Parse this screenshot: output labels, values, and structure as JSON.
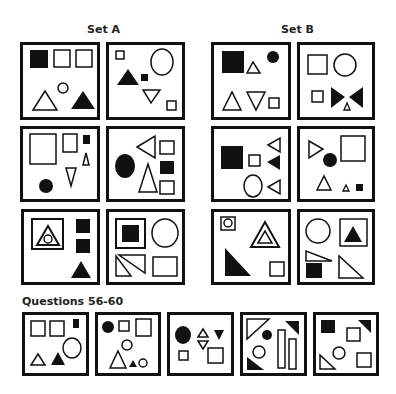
{
  "headings": {
    "set_a": "Set A",
    "set_b": "Set B",
    "questions": "Questions 56-60"
  },
  "colors": {
    "ink": "#111111",
    "paper": "#ffffff"
  },
  "set_a": [
    {
      "id": "A1",
      "shapes": [
        "filled-square",
        "outline-square",
        "outline-square",
        "outline-triangle",
        "outline-circle",
        "filled-triangle"
      ]
    },
    {
      "id": "A2",
      "shapes": [
        "outline-square-small",
        "outline-ellipse",
        "filled-triangle",
        "filled-square-small",
        "outline-triangle-down",
        "outline-square-small"
      ]
    },
    {
      "id": "A3",
      "shapes": [
        "outline-square-large",
        "outline-square",
        "filled-square-small",
        "outline-triangle-small",
        "outline-triangle-down",
        "filled-circle"
      ]
    },
    {
      "id": "A4",
      "shapes": [
        "outline-triangle-left",
        "outline-square",
        "filled-ellipse",
        "filled-square",
        "outline-triangle",
        "outline-square"
      ]
    },
    {
      "id": "A5",
      "shapes": [
        "outline-square-with-triangle-and-circle",
        "filled-square",
        "filled-square",
        "filled-triangle"
      ]
    },
    {
      "id": "A6",
      "shapes": [
        "outline-square-with-filled-square",
        "outline-circle",
        "outline-triangles-pair",
        "outline-rectangle"
      ]
    }
  ],
  "set_b": [
    {
      "id": "B1",
      "shapes": [
        "filled-square",
        "outline-triangle-small",
        "filled-circle",
        "outline-triangle",
        "outline-triangle-down",
        "outline-square-small"
      ]
    },
    {
      "id": "B2",
      "shapes": [
        "outline-square",
        "outline-circle",
        "outline-square-small",
        "filled-bowtie",
        "outline-triangle-small"
      ]
    },
    {
      "id": "B3",
      "shapes": [
        "filled-square",
        "outline-square-small",
        "outline-triangle-left",
        "filled-triangle-left",
        "outline-ellipse",
        "outline-triangle-left"
      ]
    },
    {
      "id": "B4",
      "shapes": [
        "outline-triangle-right",
        "filled-circle",
        "outline-square-large",
        "outline-triangle",
        "outline-triangle-small",
        "filled-square-small"
      ]
    },
    {
      "id": "B5",
      "shapes": [
        "outline-square-with-circle",
        "outline-triangle-double",
        "filled-right-triangle",
        "outline-square"
      ]
    },
    {
      "id": "B6",
      "shapes": [
        "outline-circle",
        "outline-square-with-filled-triangle",
        "outline-right-triangle",
        "filled-square",
        "outline-right-triangle"
      ]
    }
  ],
  "questions": [
    {
      "number": 56,
      "shapes": [
        "outline-square",
        "outline-square",
        "filled-rect-small",
        "outline-triangle",
        "filled-triangle",
        "outline-circle"
      ]
    },
    {
      "number": 57,
      "shapes": [
        "filled-circle",
        "outline-square-small",
        "outline-square",
        "outline-circle",
        "outline-triangle",
        "filled-triangle-small",
        "outline-circle-small"
      ]
    },
    {
      "number": 58,
      "shapes": [
        "filled-ellipse",
        "outline-triangle-up",
        "outline-triangle-down",
        "filled-triangle-down",
        "outline-square-small",
        "outline-square"
      ]
    },
    {
      "number": 59,
      "shapes": [
        "outline-corner-triangle",
        "filled-circle",
        "filled-corner-triangle",
        "outline-circle",
        "outline-rectangle-tall",
        "outline-rectangle-tall",
        "filled-corner-triangle"
      ]
    },
    {
      "number": 60,
      "shapes": [
        "filled-square",
        "filled-corner-triangle",
        "outline-square",
        "outline-circle",
        "outline-corner-triangle",
        "outline-square"
      ]
    }
  ]
}
